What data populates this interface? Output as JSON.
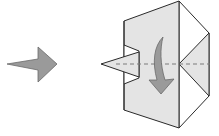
{
  "diagram": {
    "type": "origami-fold-step",
    "colors": {
      "paper_colored": "#e4e4e4",
      "paper_white": "#ffffff",
      "outline": "#2a2a2a",
      "arrow_fill": "#9a9a9a",
      "arrow_stroke": "#6a6a6a",
      "fold_line": "#7a7a7a"
    },
    "elements": {
      "step_arrow": "step-transition-arrow",
      "fold_line": "valley-fold-line",
      "fold_arrow": "fold-down-curved-arrow",
      "model": "origami-model"
    }
  }
}
